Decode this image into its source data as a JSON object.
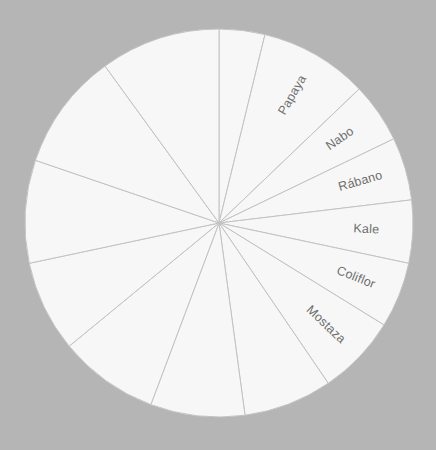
{
  "figure": {
    "background_color": "#b5b5b5",
    "slice_fill_color": "#f7f7f7",
    "slice_edge_color": "#c3c3c3",
    "label_color": "#6e6e6e",
    "center_x": 219,
    "center_y": 223,
    "radius": 194
  },
  "chart_data": {
    "type": "pie",
    "title": "",
    "subtitle": "",
    "xlabel": "",
    "ylabel": "",
    "grid": false,
    "legend": "none",
    "start_angle_deg": 0,
    "direction": "clockwise",
    "labeled_slice_count": 6,
    "total_slice_count": 14,
    "labels": [
      "",
      "Papaya",
      "Nabo",
      "Rábano",
      "Kale",
      "Coliflor",
      "Mostaza",
      "",
      "",
      "",
      "",
      "",
      "",
      ""
    ],
    "values": [
      8.0,
      19.0,
      10.5,
      11.0,
      11.0,
      11.5,
      14.0,
      15.5,
      16.5,
      17.5,
      16.0,
      18.0,
      20.5,
      21.0
    ],
    "categories": [
      "slice-1",
      "Papaya",
      "Nabo",
      "Rábano",
      "Kale",
      "Coliflor",
      "Mostaza",
      "slice-8",
      "slice-9",
      "slice-10",
      "slice-11",
      "slice-12",
      "slice-13",
      "slice-14"
    ]
  }
}
